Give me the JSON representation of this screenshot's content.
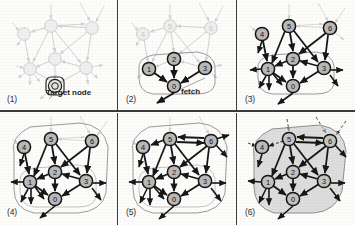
{
  "figure": {
    "panel_count": 6,
    "grid": "2 rows x 3 columns",
    "style": {
      "background": "#fdfdfc",
      "node_fill_active": "#b9b9b9",
      "node_fill_faded": "#ececec",
      "node_stroke_active": "#1b1b1b",
      "node_stroke_faded": "#cfcfcf",
      "edge_active": "#161616",
      "edge_faded": "#d2d2d2",
      "hull_stroke": "#8f8f8f",
      "hull_fill": "#c9c9c9",
      "divider": "#3a3a3a"
    }
  },
  "nodes": [
    {
      "id": "0",
      "label": "0",
      "x": 55,
      "y": 86
    },
    {
      "id": "1",
      "label": "1",
      "x": 30,
      "y": 69
    },
    {
      "id": "2",
      "label": "2",
      "x": 55,
      "y": 59
    },
    {
      "id": "3",
      "label": "3",
      "x": 86,
      "y": 68
    },
    {
      "id": "4",
      "label": "4",
      "x": 24,
      "y": 34
    },
    {
      "id": "5",
      "label": "5",
      "x": 51,
      "y": 26
    },
    {
      "id": "6",
      "label": "6",
      "x": 92,
      "y": 28
    }
  ],
  "edges": [
    {
      "from": "1",
      "to": "0"
    },
    {
      "from": "2",
      "to": "0"
    },
    {
      "from": "3",
      "to": "0"
    },
    {
      "from": "2",
      "to": "1"
    },
    {
      "from": "3",
      "to": "2"
    },
    {
      "from": "4",
      "to": "1"
    },
    {
      "from": "5",
      "to": "1"
    },
    {
      "from": "5",
      "to": "2"
    },
    {
      "from": "5",
      "to": "3"
    },
    {
      "from": "6",
      "to": "2"
    },
    {
      "from": "6",
      "to": "3"
    },
    {
      "from": "6",
      "to": "5"
    },
    {
      "from": "5",
      "to": "6"
    },
    {
      "from": "5",
      "to": "4"
    }
  ],
  "panels": [
    {
      "number": "(1)",
      "caption_label": "(1)",
      "state": "faded",
      "active_nodes": [
        "0"
      ],
      "active_edges": [],
      "hull": "none",
      "annotations": [
        {
          "name": "target-node-label",
          "text": "Target node",
          "x": 46,
          "y": 88
        }
      ]
    },
    {
      "number": "(2)",
      "caption_label": "(2)",
      "state": "first-hop",
      "active_nodes": [
        "0",
        "1",
        "2",
        "3"
      ],
      "active_edges": [
        {
          "from": "1",
          "to": "0"
        },
        {
          "from": "2",
          "to": "0"
        },
        {
          "from": "3",
          "to": "0"
        }
      ],
      "hull": "outline-1hop",
      "annotations": [
        {
          "name": "fetch-label",
          "text": "fetch",
          "x": 62,
          "y": 90
        }
      ]
    },
    {
      "number": "(3)",
      "caption_label": "(3)",
      "state": "second-hop",
      "active_nodes": [
        "0",
        "1",
        "2",
        "3",
        "4",
        "5",
        "6"
      ],
      "active_edges": [
        {
          "from": "1",
          "to": "0"
        },
        {
          "from": "2",
          "to": "0"
        },
        {
          "from": "3",
          "to": "0"
        },
        {
          "from": "2",
          "to": "1"
        },
        {
          "from": "3",
          "to": "2"
        },
        {
          "from": "4",
          "to": "1"
        },
        {
          "from": "5",
          "to": "1"
        },
        {
          "from": "5",
          "to": "2"
        },
        {
          "from": "5",
          "to": "3"
        },
        {
          "from": "6",
          "to": "2"
        },
        {
          "from": "6",
          "to": "3"
        }
      ],
      "hull": "outline-1hop",
      "annotations": []
    },
    {
      "number": "(4)",
      "caption_label": "(4)",
      "state": "expanded",
      "active_nodes": [
        "0",
        "1",
        "2",
        "3",
        "4",
        "5",
        "6"
      ],
      "active_edges": [
        {
          "from": "1",
          "to": "0"
        },
        {
          "from": "2",
          "to": "0"
        },
        {
          "from": "3",
          "to": "0"
        },
        {
          "from": "2",
          "to": "1"
        },
        {
          "from": "3",
          "to": "2"
        },
        {
          "from": "4",
          "to": "1"
        },
        {
          "from": "5",
          "to": "1"
        },
        {
          "from": "5",
          "to": "2"
        },
        {
          "from": "5",
          "to": "3"
        },
        {
          "from": "6",
          "to": "2"
        },
        {
          "from": "6",
          "to": "3"
        }
      ],
      "hull": "outline-2hop",
      "annotations": []
    },
    {
      "number": "(5)",
      "caption_label": "(5)",
      "state": "all-edges-active",
      "active_nodes": [
        "0",
        "1",
        "2",
        "3",
        "4",
        "5",
        "6"
      ],
      "active_edges": [
        {
          "from": "1",
          "to": "0"
        },
        {
          "from": "2",
          "to": "0"
        },
        {
          "from": "3",
          "to": "0"
        },
        {
          "from": "2",
          "to": "1"
        },
        {
          "from": "3",
          "to": "2"
        },
        {
          "from": "4",
          "to": "1"
        },
        {
          "from": "5",
          "to": "1"
        },
        {
          "from": "5",
          "to": "2"
        },
        {
          "from": "5",
          "to": "3"
        },
        {
          "from": "6",
          "to": "2"
        },
        {
          "from": "6",
          "to": "3"
        },
        {
          "from": "6",
          "to": "5"
        },
        {
          "from": "5",
          "to": "6"
        }
      ],
      "hull": "outline-2hop",
      "annotations": []
    },
    {
      "number": "(6)",
      "caption_label": "(6)",
      "state": "aggregated-filled",
      "active_nodes": [
        "0",
        "1",
        "2",
        "3",
        "5",
        "6"
      ],
      "excluded_nodes": [
        "4"
      ],
      "active_edges": [
        {
          "from": "1",
          "to": "0"
        },
        {
          "from": "2",
          "to": "0"
        },
        {
          "from": "3",
          "to": "0"
        },
        {
          "from": "2",
          "to": "1"
        },
        {
          "from": "3",
          "to": "2"
        },
        {
          "from": "5",
          "to": "1"
        },
        {
          "from": "5",
          "to": "2"
        },
        {
          "from": "5",
          "to": "3"
        },
        {
          "from": "6",
          "to": "2"
        },
        {
          "from": "6",
          "to": "3"
        },
        {
          "from": "6",
          "to": "5"
        },
        {
          "from": "5",
          "to": "6"
        }
      ],
      "hull": "filled-region",
      "annotations": []
    }
  ]
}
